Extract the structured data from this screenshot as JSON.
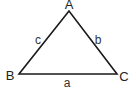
{
  "diagram": {
    "type": "triangle",
    "stroke_color": "#1a1a1a",
    "vertices": [
      {
        "name": "A",
        "x": 69,
        "y": 11
      },
      {
        "name": "B",
        "x": 19,
        "y": 74
      },
      {
        "name": "C",
        "x": 117,
        "y": 74
      }
    ],
    "vertex_labels": {
      "A": "A",
      "B": "B",
      "C": "C"
    },
    "side_labels": {
      "a": "a",
      "b": "b",
      "c": "c"
    }
  }
}
